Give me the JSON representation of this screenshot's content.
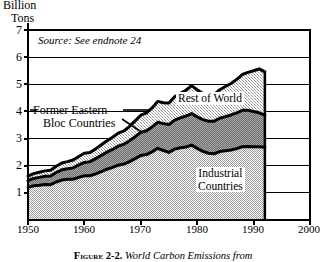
{
  "axes": {
    "y_axis_label_line1": "Billion",
    "y_axis_label_line2": "Tons",
    "y_ticks": [
      "7",
      "6",
      "5",
      "4",
      "3",
      "2",
      "1"
    ],
    "y_tick_values": [
      7,
      6,
      5,
      4,
      3,
      2,
      1
    ],
    "x_ticks": [
      "1950",
      "1960",
      "1970",
      "1980",
      "1990",
      "2000"
    ],
    "x_tick_values": [
      1950,
      1960,
      1970,
      1980,
      1990,
      2000
    ],
    "ylim": [
      0,
      7
    ],
    "xlim": [
      1950,
      2000
    ],
    "grid": "horizontal"
  },
  "annotations": {
    "source_note": "Source: See endnote 24",
    "label_rest_of_world": "Rest of  World",
    "label_industrial_line1": "Industrial",
    "label_industrial_line2": "Countries",
    "label_former_eastern_line1": "Former Eastern",
    "label_former_eastern_line2": "Bloc Countries"
  },
  "caption": {
    "figure_number": "Figure 2-2.",
    "text": "World Carbon Emissions from"
  },
  "colors": {
    "background": "#ffffff",
    "ink": "#000000",
    "industrial_fill": "#c9c9c9",
    "eastern_bloc_fill": "#8a8a8a",
    "rest_of_world_fill": "#bdbdbd",
    "gridline": "#000000",
    "frame": "#000000"
  },
  "chart_data": {
    "type": "area",
    "stacked": true,
    "title": "World Carbon Emissions from",
    "xlabel": "",
    "ylabel": "Billion Tons",
    "xlim": [
      1950,
      2000
    ],
    "ylim": [
      0,
      7
    ],
    "grid": true,
    "legend": "inline-labels",
    "x": [
      1950,
      1951,
      1952,
      1953,
      1954,
      1955,
      1956,
      1957,
      1958,
      1959,
      1960,
      1961,
      1962,
      1963,
      1964,
      1965,
      1966,
      1967,
      1968,
      1969,
      1970,
      1971,
      1972,
      1973,
      1974,
      1975,
      1976,
      1977,
      1978,
      1979,
      1980,
      1981,
      1982,
      1983,
      1984,
      1985,
      1986,
      1987,
      1988,
      1989,
      1990,
      1991,
      1992
    ],
    "series": [
      {
        "name": "Industrial Countries",
        "values": [
          1.2,
          1.26,
          1.28,
          1.31,
          1.3,
          1.4,
          1.47,
          1.5,
          1.5,
          1.57,
          1.63,
          1.63,
          1.7,
          1.78,
          1.87,
          1.94,
          2.02,
          2.06,
          2.15,
          2.26,
          2.38,
          2.41,
          2.51,
          2.64,
          2.56,
          2.49,
          2.61,
          2.66,
          2.69,
          2.76,
          2.64,
          2.53,
          2.46,
          2.44,
          2.52,
          2.55,
          2.58,
          2.63,
          2.7,
          2.71,
          2.7,
          2.7,
          2.68
        ]
      },
      {
        "name": "Former Eastern Bloc Countries",
        "values": [
          0.25,
          0.27,
          0.29,
          0.3,
          0.32,
          0.35,
          0.38,
          0.39,
          0.42,
          0.46,
          0.49,
          0.52,
          0.56,
          0.6,
          0.63,
          0.66,
          0.7,
          0.73,
          0.77,
          0.81,
          0.85,
          0.88,
          0.92,
          0.96,
          0.99,
          1.03,
          1.07,
          1.1,
          1.14,
          1.16,
          1.16,
          1.17,
          1.18,
          1.2,
          1.23,
          1.26,
          1.29,
          1.32,
          1.34,
          1.33,
          1.3,
          1.25,
          1.18
        ]
      },
      {
        "name": "Rest of World",
        "values": [
          0.17,
          0.18,
          0.19,
          0.2,
          0.21,
          0.23,
          0.25,
          0.26,
          0.29,
          0.31,
          0.34,
          0.34,
          0.36,
          0.39,
          0.42,
          0.45,
          0.48,
          0.49,
          0.53,
          0.58,
          0.63,
          0.66,
          0.7,
          0.77,
          0.77,
          0.79,
          0.86,
          0.91,
          0.95,
          1.03,
          1.0,
          0.96,
          0.96,
          0.98,
          1.05,
          1.11,
          1.16,
          1.23,
          1.32,
          1.4,
          1.5,
          1.62,
          1.6
        ]
      }
    ],
    "totals": [
      1.62,
      1.71,
      1.76,
      1.81,
      1.83,
      1.98,
      2.1,
      2.15,
      2.21,
      2.34,
      2.46,
      2.49,
      2.62,
      2.77,
      2.92,
      3.05,
      3.2,
      3.28,
      3.45,
      3.65,
      3.86,
      3.95,
      4.13,
      4.37,
      4.32,
      4.31,
      4.54,
      4.67,
      4.78,
      4.95,
      4.8,
      4.66,
      4.6,
      4.62,
      4.8,
      4.92,
      5.03,
      5.18,
      5.36,
      5.44,
      5.5,
      5.57,
      5.46
    ]
  }
}
